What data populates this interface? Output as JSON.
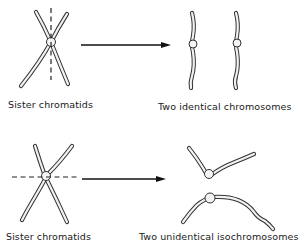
{
  "figure": {
    "top_row": {
      "left_label": "Sister chromatids",
      "right_label": "Two identical chromosomes",
      "division_line": "vertical"
    },
    "bottom_row": {
      "left_label": "Sister chromatids",
      "right_label": "Two unidentical isochromosomes",
      "division_line": "horizontal"
    }
  },
  "colors": {
    "line": "#333333",
    "background": "#ffffff"
  }
}
